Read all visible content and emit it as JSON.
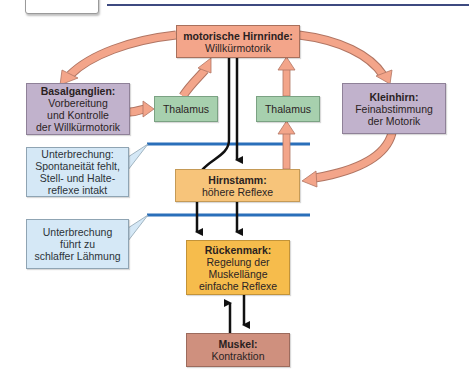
{
  "diagram": {
    "colors": {
      "cortex": "#f3a58a",
      "basal": "#c1b2cc",
      "thalamus": "#a7d0ae",
      "brainstem": "#f7c47a",
      "spinal": "#f6bc4c",
      "muscle": "#cf907e",
      "callout": "#d5e8f6",
      "interruption_line": "#2a6fba",
      "arrow_fill": "#f3a58a",
      "header_rule": "#3d4a80"
    },
    "nodes": {
      "cortex": {
        "title": "motorische Hirnrinde:",
        "sub": "Willkürmotorik"
      },
      "basal_ganglia": {
        "title": "Basalganglien:",
        "sub1": "Vorbereitung",
        "sub2": "und Kontrolle",
        "sub3": "der Willkürmotorik"
      },
      "thalamus_left": {
        "label": "Thalamus"
      },
      "thalamus_right": {
        "label": "Thalamus"
      },
      "cerebellum": {
        "title": "Kleinhirn:",
        "sub1": "Feinabstimmung",
        "sub2": "der Motorik"
      },
      "brainstem": {
        "title": "Hirnstamm:",
        "sub": "höhere Reflexe"
      },
      "spinal_cord": {
        "title": "Rückenmark:",
        "sub1": "Regelung der",
        "sub2": "Muskellänge",
        "sub3": "einfache Reflexe"
      },
      "muscle": {
        "title": "Muskel:",
        "sub": "Kontraktion"
      }
    },
    "callouts": [
      {
        "line1": "Unterbrechung:",
        "line2": "Spontaneität fehlt,",
        "line3": "Stell- und Halte-",
        "line4": "reflexe intakt"
      },
      {
        "line1": "Unterbrechung",
        "line2": "führt zu",
        "line3": "schlaffer Lähmung"
      }
    ]
  }
}
